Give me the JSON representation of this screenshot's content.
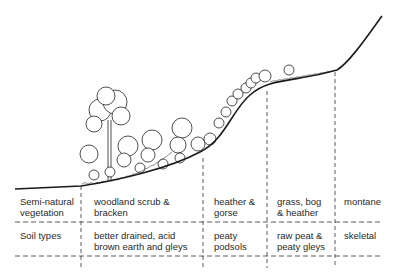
{
  "diagram": {
    "type": "hillslope-vegetation-soil-profile",
    "rows": [
      {
        "label_line1": "Semi-natural",
        "label_line2": "vegetation",
        "cells": [
          {
            "line1": "woodland scrub &",
            "line2": "bracken"
          },
          {
            "line1": "heather &",
            "line2": "gorse"
          },
          {
            "line1": "grass, bog",
            "line2": "& heather"
          },
          {
            "line1": "montane",
            "line2": ""
          }
        ]
      },
      {
        "label_line1": "Soil types",
        "label_line2": "",
        "cells": [
          {
            "line1": "better drained, acid",
            "line2": "brown earth and gleys"
          },
          {
            "line1": "peaty",
            "line2": "podsols"
          },
          {
            "line1": "raw peat &",
            "line2": "peaty gleys"
          },
          {
            "line1": "skeletal",
            "line2": ""
          }
        ]
      }
    ],
    "zones": [
      "woodland",
      "heather",
      "grass-bog",
      "montane"
    ],
    "colors": {
      "line": "#1a1a1a",
      "text": "#2a2a2a",
      "background": "#ffffff"
    }
  }
}
